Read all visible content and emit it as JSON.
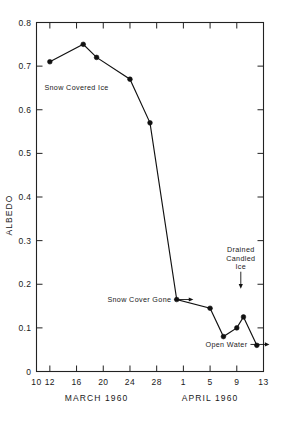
{
  "chart_data": {
    "type": "line",
    "title": "",
    "xlabel": "",
    "ylabel": "ALBEDO",
    "ylim": [
      0,
      0.8
    ],
    "xlim": [
      0,
      34
    ],
    "grid": false,
    "legend": "none",
    "y_ticks": [
      "0",
      "0.1",
      "0.2",
      "0.3",
      "0.4",
      "0.5",
      "0.6",
      "0.7",
      "0.8"
    ],
    "y_tick_values": [
      0,
      0.1,
      0.2,
      0.3,
      0.4,
      0.5,
      0.6,
      0.7,
      0.8
    ],
    "x_ticks": [
      "10",
      "12",
      "16",
      "20",
      "24",
      "28",
      "1",
      "5",
      "9",
      "13"
    ],
    "x_tick_values": [
      0,
      2,
      6,
      10,
      14,
      18,
      22,
      26,
      30,
      34
    ],
    "x_period_labels": [
      {
        "text": "MARCH  1960",
        "at": 9
      },
      {
        "text": "APRIL  1960",
        "at": 26
      }
    ],
    "x": [
      2,
      7,
      9,
      14,
      17,
      21,
      26,
      28,
      30,
      31,
      33
    ],
    "y": [
      0.71,
      0.75,
      0.72,
      0.67,
      0.57,
      0.165,
      0.145,
      0.08,
      0.1,
      0.125,
      0.06
    ],
    "point_dates": [
      "March 12",
      "March 17",
      "March 19",
      "March 24",
      "March 27",
      "March 31",
      "April 5",
      "April 7",
      "April 9",
      "April 10",
      "April 12"
    ],
    "annotations": [
      {
        "text": "Snow Covered Ice",
        "x": 6.0,
        "y": 0.645,
        "leader": "none"
      },
      {
        "text": "Snow Cover Gone",
        "x": 20.2,
        "y": 0.165,
        "leader": "right-arrow"
      },
      {
        "text": "Drained Candled Ice",
        "lines": [
          "Drained",
          "Candled",
          "Ice"
        ],
        "x": 30.6,
        "y": 0.215,
        "leader": "down-arrow"
      },
      {
        "text": "Open Water",
        "x": 31.6,
        "y": 0.062,
        "leader": "right-arrow"
      }
    ]
  },
  "colors": {
    "line": "#111111",
    "marker": "#111111",
    "axis": "#222222",
    "background": "#ffffff"
  }
}
